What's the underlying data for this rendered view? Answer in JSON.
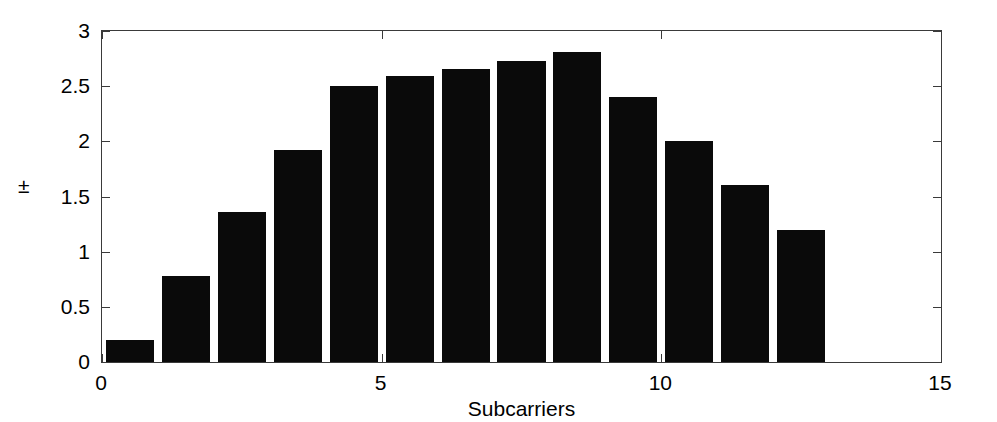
{
  "chart_data": {
    "type": "bar",
    "title": "",
    "subtitle": "",
    "xlabel": "Subcarriers",
    "ylabel": "±",
    "xlim": [
      0,
      15
    ],
    "ylim": [
      0,
      3
    ],
    "xticks": [
      0,
      5,
      10,
      15
    ],
    "xtick_labels": [
      "0",
      "5",
      "10",
      "15"
    ],
    "yticks": [
      0,
      0.5,
      1,
      1.5,
      2,
      2.5,
      3
    ],
    "ytick_labels": [
      "0",
      "0.5",
      "1",
      "1.5",
      "2",
      "2.5",
      "3"
    ],
    "grid": false,
    "legend": null,
    "bar_color": "#0a0a0a",
    "axis_color": "#3a3a3a",
    "background": "#ffffff",
    "bar_width": 0.86,
    "categories": [
      0,
      1,
      2,
      3,
      4,
      5,
      6,
      7,
      8,
      9,
      10,
      11,
      12
    ],
    "values": [
      0.2,
      0.78,
      1.36,
      1.92,
      2.5,
      2.59,
      2.66,
      2.73,
      2.81,
      2.4,
      2.0,
      1.6,
      1.2
    ],
    "series": [
      {
        "name": "",
        "values": [
          0.2,
          0.78,
          1.36,
          1.92,
          2.5,
          2.59,
          2.66,
          2.73,
          2.81,
          2.4,
          2.0,
          1.6,
          1.2
        ]
      }
    ],
    "annotations": []
  }
}
